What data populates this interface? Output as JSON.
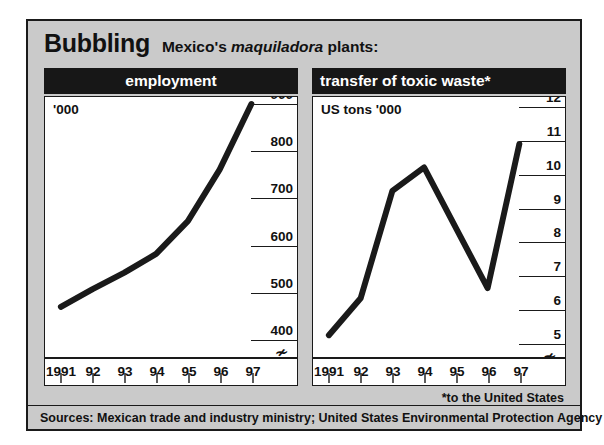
{
  "title": {
    "main": "Bubbling",
    "sub_before": "Mexico's ",
    "sub_italic": "maquiladora",
    "sub_after": " plants:"
  },
  "footnote": "*to the United States",
  "sources": "Sources: Mexican trade and industry ministry; United States Environmental Protection Agency",
  "colors": {
    "background": "#cacaca",
    "header_bar": "#171717",
    "line": "#1a1a1a",
    "plot_background": "#ffffff"
  },
  "panels": {
    "left": {
      "header": "employment",
      "unit": "'000",
      "ticks": [
        "900",
        "800",
        "700",
        "600",
        "500",
        "400"
      ],
      "break_symbol": "≁",
      "x_labels": [
        "1991",
        "92",
        "93",
        "94",
        "95",
        "96",
        "97"
      ]
    },
    "right": {
      "header": "transfer of toxic waste*",
      "unit": "US tons '000",
      "ticks": [
        "12",
        "11",
        "10",
        "9",
        "8",
        "7",
        "6",
        "5"
      ],
      "break_symbol": "≁",
      "x_labels": [
        "1991",
        "92",
        "93",
        "94",
        "95",
        "96",
        "97"
      ]
    }
  },
  "chart_data": [
    {
      "type": "line",
      "title": "employment",
      "subtitle": "Mexico's maquiladora plants",
      "ylabel": "'000",
      "xlabel": "",
      "categories": [
        "1991",
        "92",
        "93",
        "94",
        "95",
        "96",
        "97"
      ],
      "values": [
        467,
        505,
        540,
        580,
        650,
        760,
        900
      ],
      "ylim": [
        360,
        915
      ],
      "yticks": [
        400,
        500,
        600,
        700,
        800,
        900
      ],
      "axis_break": true,
      "grid": true,
      "legend": "none"
    },
    {
      "type": "line",
      "title": "transfer of toxic waste*",
      "subtitle": "to the United States",
      "ylabel": "US tons '000",
      "xlabel": "",
      "categories": [
        "1991",
        "92",
        "93",
        "94",
        "95",
        "96",
        "97"
      ],
      "values": [
        5.2,
        6.3,
        9.5,
        10.2,
        8.4,
        6.6,
        10.9
      ],
      "ylim": [
        4.55,
        12.3
      ],
      "yticks": [
        5,
        6,
        7,
        8,
        9,
        10,
        11,
        12
      ],
      "axis_break": true,
      "grid": true,
      "legend": "none"
    }
  ]
}
